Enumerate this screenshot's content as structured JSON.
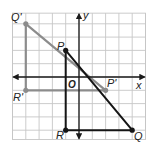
{
  "diagram": {
    "type": "coordinate-plane-reflection",
    "origin_px": [
      79,
      77
    ],
    "unit_px": 13.3,
    "grid": {
      "x_min": -5,
      "x_max": 5,
      "y_min": -4.7,
      "y_max": 4.8,
      "line_color": "#c6c6c6"
    },
    "axes": {
      "x_label": "x",
      "y_label": "y",
      "origin_label": "O",
      "color": "#1a1a1a"
    },
    "original_triangle": {
      "color": "#151515",
      "vertices": [
        {
          "name": "P",
          "x": -1,
          "y": 2
        },
        {
          "name": "Q",
          "x": 4,
          "y": -4
        },
        {
          "name": "R",
          "x": -1,
          "y": -4
        }
      ]
    },
    "image_triangle": {
      "color": "#8c8c8c",
      "vertices": [
        {
          "name": "P'",
          "x": 2,
          "y": -1
        },
        {
          "name": "Q'",
          "x": -4,
          "y": 4
        },
        {
          "name": "R'",
          "x": -4,
          "y": -1
        }
      ]
    }
  }
}
